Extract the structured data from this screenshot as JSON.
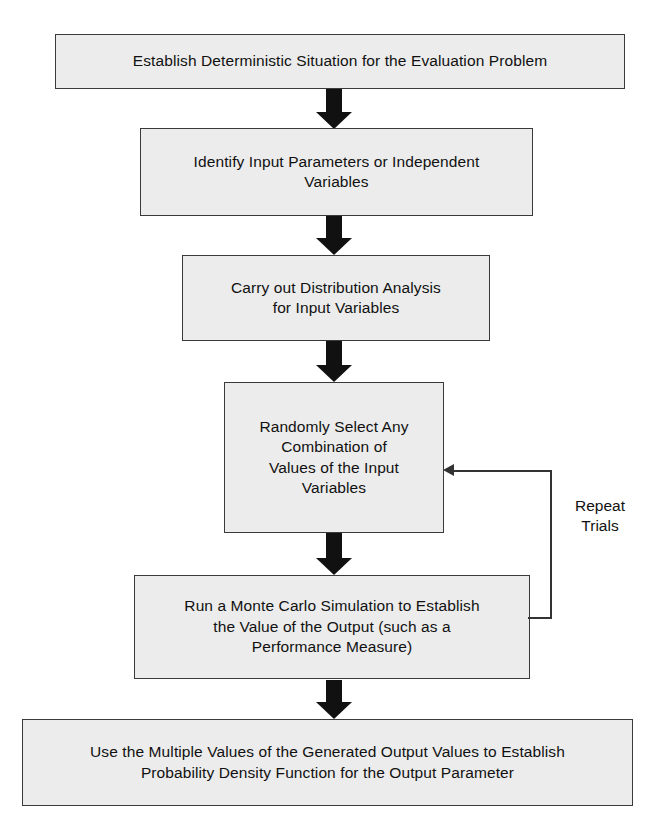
{
  "diagram": {
    "colors": {
      "box_fill": "#ececec",
      "box_border": "#3a3a3a",
      "arrow": "#111111",
      "loop_line": "#333333",
      "text": "#111111",
      "background": "#ffffff"
    },
    "steps": [
      {
        "id": "step-1",
        "text": "Establish Deterministic Situation for the Evaluation Problem"
      },
      {
        "id": "step-2",
        "text": "Identify Input Parameters or Independent\nVariables"
      },
      {
        "id": "step-3",
        "text": "Carry out Distribution Analysis\nfor Input Variables"
      },
      {
        "id": "step-4",
        "text": "Randomly Select Any\nCombination of\nValues of the Input\nVariables"
      },
      {
        "id": "step-5",
        "text": "Run a Monte Carlo Simulation to Establish\nthe Value of the Output (such as a\nPerformance Measure)"
      },
      {
        "id": "step-6",
        "text": "Use the Multiple Values of the Generated Output Values to Establish\nProbability Density Function for the Output Parameter"
      }
    ],
    "loop": {
      "label": "Repeat\nTrials",
      "from_step": "step-5",
      "to_step": "step-4"
    },
    "connectors": [
      {
        "id": "connector-1",
        "from": "step-1",
        "to": "step-2",
        "kind": "down-arrow"
      },
      {
        "id": "connector-2",
        "from": "step-2",
        "to": "step-3",
        "kind": "down-arrow"
      },
      {
        "id": "connector-3",
        "from": "step-3",
        "to": "step-4",
        "kind": "down-arrow"
      },
      {
        "id": "connector-4",
        "from": "step-4",
        "to": "step-5",
        "kind": "down-arrow"
      },
      {
        "id": "connector-5",
        "from": "step-5",
        "to": "step-6",
        "kind": "down-arrow"
      }
    ]
  }
}
